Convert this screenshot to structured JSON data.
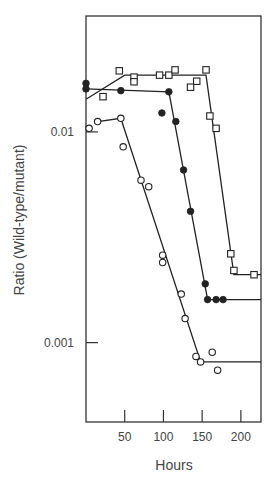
{
  "chart_data": {
    "type": "scatter",
    "title": "",
    "xlabel": "Hours",
    "ylabel": "Ratio (Wild-type/mutant)",
    "yscale": "log",
    "xlim": [
      0,
      226
    ],
    "ylim": [
      0.00042,
      0.0355
    ],
    "x_ticks": [
      50,
      100,
      150,
      200
    ],
    "x_tick_labels": [
      "50",
      "100",
      "150",
      "200"
    ],
    "y_ticks": [
      0.01,
      0.001
    ],
    "y_tick_labels": [
      "0.01",
      "0.001"
    ],
    "grid": false,
    "legend": null,
    "series": [
      {
        "name": "filled circles",
        "marker": "filled-circle",
        "points": [
          [
            0,
            0.017
          ],
          [
            0,
            0.016
          ],
          [
            45,
            0.0157
          ],
          [
            107,
            0.0155
          ],
          [
            98,
            0.0123
          ],
          [
            116,
            0.0112
          ],
          [
            126,
            0.0066
          ],
          [
            135,
            0.0042
          ],
          [
            154,
            0.0019
          ],
          [
            157,
            0.0016
          ],
          [
            168,
            0.0016
          ],
          [
            177,
            0.0016
          ]
        ],
        "fit_line": [
          [
            0,
            0.016
          ],
          [
            107,
            0.0155
          ],
          [
            157,
            0.0016
          ],
          [
            226,
            0.0016
          ]
        ]
      },
      {
        "name": "open squares",
        "marker": "open-square",
        "points": [
          [
            22,
            0.0147
          ],
          [
            43,
            0.0195
          ],
          [
            62,
            0.0182
          ],
          [
            62,
            0.0173
          ],
          [
            95,
            0.0186
          ],
          [
            107,
            0.0186
          ],
          [
            115,
            0.0197
          ],
          [
            155,
            0.0197
          ],
          [
            143,
            0.0174
          ],
          [
            135,
            0.0163
          ],
          [
            160,
            0.0119
          ],
          [
            168,
            0.0104
          ],
          [
            187,
            0.00264
          ],
          [
            191,
            0.0022
          ],
          [
            217,
            0.0021
          ]
        ],
        "fit_line": [
          [
            0,
            0.0143
          ],
          [
            50,
            0.0186
          ],
          [
            155,
            0.0186
          ],
          [
            191,
            0.0021
          ],
          [
            226,
            0.0021
          ]
        ]
      },
      {
        "name": "open circles",
        "marker": "open-circle",
        "points": [
          [
            4,
            0.0104
          ],
          [
            15,
            0.0112
          ],
          [
            45,
            0.0116
          ],
          [
            48,
            0.0085
          ],
          [
            71,
            0.0059
          ],
          [
            81,
            0.0055
          ],
          [
            99,
            0.0026
          ],
          [
            99,
            0.0024
          ],
          [
            123,
            0.0017
          ],
          [
            128,
            0.0013
          ],
          [
            142,
            0.00086
          ],
          [
            148,
            0.00081
          ],
          [
            163,
            0.0009
          ],
          [
            170,
            0.00074
          ]
        ],
        "fit_line": [
          [
            15,
            0.0112
          ],
          [
            45,
            0.0116
          ],
          [
            148,
            0.00081
          ],
          [
            226,
            0.00081
          ]
        ]
      }
    ]
  }
}
